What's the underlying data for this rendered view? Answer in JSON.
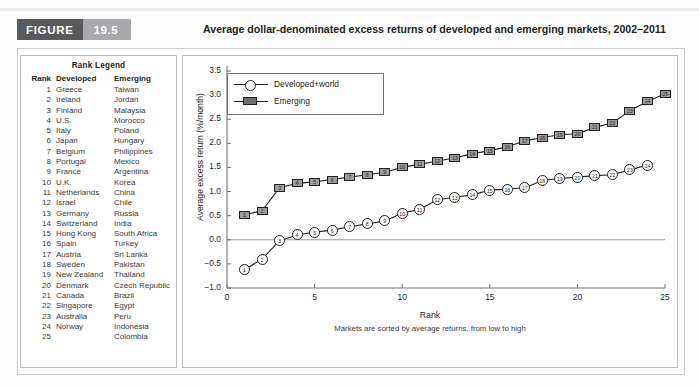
{
  "header": {
    "figure_label": "FIGURE",
    "figure_number": "19.5",
    "title": "Average dollar-denominated excess returns of developed and emerging markets, 2002–2011",
    "badge_dark": "#58595b",
    "badge_light": "#a7a9ac"
  },
  "legend_table": {
    "title": "Rank Legend",
    "columns": [
      "Rank",
      "Developed",
      "Emerging"
    ],
    "rows": [
      [
        "1",
        "Greece",
        "Taiwan"
      ],
      [
        "2",
        "Ireland",
        "Jordan"
      ],
      [
        "3",
        "Finland",
        "Malaysia"
      ],
      [
        "4",
        "U.S.",
        "Morocco"
      ],
      [
        "5",
        "Italy",
        "Poland"
      ],
      [
        "6",
        "Japan",
        "Hungary"
      ],
      [
        "7",
        "Belgium",
        "Philippines"
      ],
      [
        "8",
        "Portugal",
        "Mexico"
      ],
      [
        "9",
        "France",
        "Argentina"
      ],
      [
        "10",
        "U.K.",
        "Korea"
      ],
      [
        "11",
        "Netherlands",
        "China"
      ],
      [
        "12",
        "Israel",
        "Chile"
      ],
      [
        "13",
        "Germany",
        "Russia"
      ],
      [
        "14",
        "Switzerland",
        "India"
      ],
      [
        "15",
        "Hong Kong",
        "South Africa"
      ],
      [
        "16",
        "Spain",
        "Turkey"
      ],
      [
        "17",
        "Austria",
        "Sri Lanka"
      ],
      [
        "18",
        "Sweden",
        "Pakistan"
      ],
      [
        "19",
        "New Zealand",
        "Thailand"
      ],
      [
        "20",
        "Denmark",
        "Czech Republic"
      ],
      [
        "21",
        "Canada",
        "Brazil"
      ],
      [
        "22",
        "Singapore",
        "Egypt"
      ],
      [
        "23",
        "Australia",
        "Peru"
      ],
      [
        "24",
        "Norway",
        "Indonesia"
      ],
      [
        "25",
        "",
        "Colombia"
      ]
    ]
  },
  "chart_data": {
    "type": "line",
    "title": "Average dollar-denominated excess returns of developed and emerging markets, 2002–2011",
    "xlabel": "Rank",
    "ylabel": "Average excess return (%/month)",
    "note": "Markets are sorted by average returns, from low to high",
    "xlim": [
      0,
      25
    ],
    "ylim": [
      -1.0,
      3.5
    ],
    "xticks": [
      0,
      5,
      10,
      15,
      20,
      25
    ],
    "yticks": [
      -1.0,
      -0.5,
      0.0,
      0.5,
      1.0,
      1.5,
      2.0,
      2.5,
      3.0,
      3.5
    ],
    "ytick_labels": [
      "−1.0",
      "−0.5",
      "0.0",
      "0.5",
      "1.0",
      "1.5",
      "2.0",
      "2.5",
      "3.0",
      "3.5"
    ],
    "xtick_labels": [
      "0",
      "5",
      "10",
      "15",
      "20",
      "25"
    ],
    "grid": false,
    "zero_line": true,
    "legend_position": "upper left",
    "series": [
      {
        "name": "Developed+world",
        "marker": "circle-numbered",
        "x": [
          1,
          2,
          3,
          4,
          5,
          6,
          7,
          8,
          9,
          10,
          11,
          12,
          13,
          14,
          15,
          16,
          17,
          18,
          19,
          20,
          21,
          22,
          23,
          24
        ],
        "values": [
          -0.62,
          -0.4,
          -0.02,
          0.1,
          0.16,
          0.2,
          0.27,
          0.33,
          0.39,
          0.55,
          0.63,
          0.83,
          0.88,
          0.93,
          1.03,
          1.05,
          1.08,
          1.23,
          1.27,
          1.3,
          1.33,
          1.35,
          1.45,
          1.55
        ]
      },
      {
        "name": "Emerging",
        "marker": "square-numbered",
        "x": [
          1,
          2,
          3,
          4,
          5,
          6,
          7,
          8,
          9,
          10,
          11,
          12,
          13,
          14,
          15,
          16,
          17,
          18,
          19,
          20,
          21,
          22,
          23,
          24,
          25
        ],
        "values": [
          0.52,
          0.6,
          1.08,
          1.17,
          1.2,
          1.25,
          1.3,
          1.35,
          1.4,
          1.5,
          1.57,
          1.63,
          1.7,
          1.78,
          1.85,
          1.93,
          2.05,
          2.12,
          2.18,
          2.2,
          2.33,
          2.42,
          2.68,
          2.87,
          3.03
        ]
      }
    ]
  }
}
